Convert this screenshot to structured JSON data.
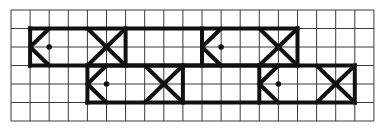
{
  "diagram": {
    "grid": {
      "columns": 19,
      "rows": 6,
      "origin_px": [
        11,
        10
      ],
      "cell_px": [
        19.1,
        18.5
      ],
      "line_color": "#3a3a3a"
    },
    "stroke_color": "#111111",
    "bands": [
      {
        "name": "top-band",
        "col_start": 1,
        "col_end": 15,
        "row_top": 1,
        "row_bottom": 3,
        "motifs": [
          {
            "head_col": 1,
            "eye": [
              2,
              2
            ],
            "x_box": [
              4,
              6
            ]
          },
          {
            "head_col": 10,
            "eye": [
              11,
              2
            ],
            "x_box": [
              13,
              15
            ]
          }
        ]
      },
      {
        "name": "bottom-band",
        "col_start": 4,
        "col_end": 18,
        "row_top": 3,
        "row_bottom": 5,
        "motifs": [
          {
            "head_col": 4,
            "eye": [
              5,
              4
            ],
            "x_box": [
              7,
              9
            ]
          },
          {
            "head_col": 13,
            "eye": [
              14,
              4
            ],
            "x_box": [
              16,
              18
            ]
          }
        ]
      }
    ]
  }
}
